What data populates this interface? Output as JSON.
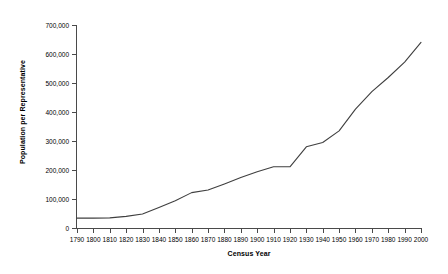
{
  "chart_data": {
    "type": "line",
    "title": "",
    "xlabel": "Census Year",
    "ylabel": "Population per Representative",
    "xlim": [
      1790,
      2000
    ],
    "ylim": [
      0,
      700000
    ],
    "grid": false,
    "legend": "none",
    "x_tick_labels": [
      "1790",
      "1800",
      "1810",
      "1820",
      "1830",
      "1840",
      "1850",
      "1860",
      "1870",
      "1880",
      "1890",
      "1900",
      "1910",
      "1920",
      "1930",
      "1940",
      "1950",
      "1960",
      "1970",
      "1980",
      "1990",
      "2000"
    ],
    "y_tick_labels": [
      "0",
      "100,000",
      "200,000",
      "300,000",
      "400,000",
      "500,000",
      "600,000",
      "700,000"
    ],
    "y_tick_values": [
      0,
      100000,
      200000,
      300000,
      400000,
      500000,
      600000,
      700000
    ],
    "series": [
      {
        "name": "Population per Representative",
        "color": "#3f3f3f",
        "x": [
          1790,
          1800,
          1810,
          1820,
          1830,
          1840,
          1850,
          1860,
          1870,
          1880,
          1890,
          1900,
          1910,
          1920,
          1930,
          1940,
          1950,
          1960,
          1970,
          1980,
          1990,
          2000
        ],
        "values": [
          34000,
          34000,
          35000,
          40000,
          48000,
          71000,
          94000,
          122000,
          131000,
          152000,
          174000,
          194000,
          211000,
          211000,
          280000,
          295000,
          335000,
          410000,
          470000,
          519000,
          572000,
          640000
        ]
      }
    ]
  }
}
